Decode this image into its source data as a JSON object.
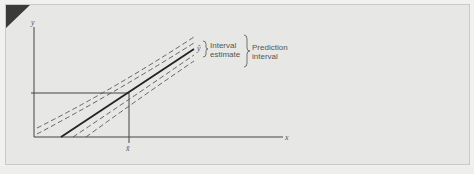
{
  "figure": {
    "type": "regression-interval-diagram",
    "axes": {
      "y_label": "y",
      "x_label": "x",
      "x_mean_label": "x̄"
    },
    "lines": {
      "regression_line_label": "ŷ",
      "regression_style": "solid",
      "interval_bands_style": "dashed"
    },
    "annotations": {
      "interval_estimate": [
        "Interval",
        "estimate"
      ],
      "prediction_interval": [
        "Prediction",
        "interval"
      ]
    },
    "colors": {
      "panel_background": "#e7e7e5",
      "line": "#333333",
      "corner_marker": "#3a3a3a"
    }
  }
}
